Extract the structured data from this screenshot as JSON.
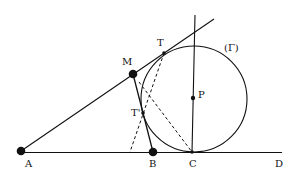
{
  "diagram": {
    "title": "",
    "colors": {
      "stroke": "#111111",
      "background": "#ffffff"
    },
    "points": {
      "A": {
        "label": "A",
        "x": 21,
        "y": 152
      },
      "B": {
        "label": "B",
        "x": 153,
        "y": 152
      },
      "C": {
        "label": "C",
        "x": 192,
        "y": 152
      },
      "D": {
        "label": "D",
        "x": 280,
        "y": 152
      },
      "M": {
        "label": "M",
        "x": 133,
        "y": 74
      },
      "T": {
        "label": "T",
        "x": 164,
        "y": 53
      },
      "T_prime": {
        "label": "T'",
        "x": 143,
        "y": 113
      },
      "P": {
        "label": "P",
        "x": 193,
        "y": 98
      }
    },
    "circle": {
      "label": "(Γ)",
      "cx": 194,
      "cy": 99,
      "r": 53
    },
    "lines": [
      {
        "name": "baseline-ad",
        "from": "A",
        "to": "D",
        "style": "solid"
      },
      {
        "name": "tangent-a-through-m-t",
        "from": "A",
        "to": "T",
        "extends_to": [
          214,
          19
        ],
        "style": "solid"
      },
      {
        "name": "segment-m-b",
        "from": "M",
        "to": "B",
        "style": "solid"
      },
      {
        "name": "vertical-through-c-p",
        "from": "C",
        "to": "P",
        "extends_to": [
          195,
          15
        ],
        "style": "solid"
      },
      {
        "name": "dashed-t-to-baseline",
        "from": "T",
        "to": [
          130,
          152
        ],
        "style": "dashed"
      },
      {
        "name": "dashed-m-to-c",
        "from": [
          139,
          82
        ],
        "to": "C",
        "style": "dashed"
      }
    ]
  }
}
